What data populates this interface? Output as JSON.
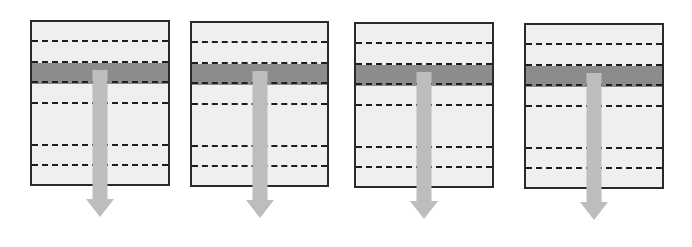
{
  "diagram": {
    "colors": {
      "panel_fill": "#efefef",
      "panel_border": "#2a2a2a",
      "band_fill": "#8c8c8c",
      "dash_color": "#1e1e1e",
      "arrow_fill": "#bdbdbd"
    },
    "panels": [
      {
        "id": 1,
        "x": 30,
        "y": 20,
        "w": 140,
        "h": 166,
        "arrow_x": 92
      },
      {
        "id": 2,
        "x": 190,
        "y": 21,
        "w": 139,
        "h": 166,
        "arrow_x": 252
      },
      {
        "id": 3,
        "x": 354,
        "y": 22,
        "w": 140,
        "h": 166,
        "arrow_x": 416
      },
      {
        "id": 4,
        "x": 524,
        "y": 23,
        "w": 140,
        "h": 166,
        "arrow_x": 586
      }
    ],
    "dash_offsets": [
      20,
      41,
      61,
      82,
      124,
      144
    ],
    "band": {
      "top": 41,
      "height": 21
    },
    "arrow": {
      "shaft_width": 15,
      "head_width": 28,
      "start_offset": 50,
      "length": 212
    }
  }
}
